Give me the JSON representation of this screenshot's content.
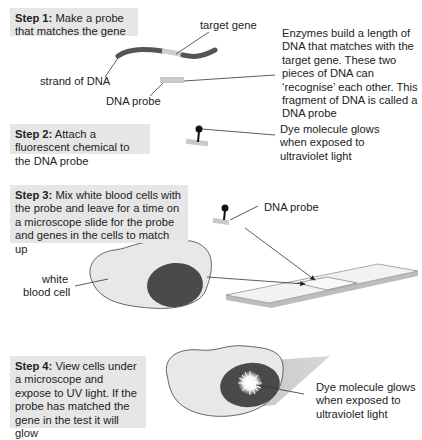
{
  "steps": [
    {
      "label": "Step 1:",
      "text": " Make a probe that matches the gene"
    },
    {
      "label": "Step 2:",
      "text": " Attach a fluorescent chemical to the DNA probe"
    },
    {
      "label": "Step 3:",
      "text": " Mix white blood cells with the probe and leave for a time on a microscope slide for the probe and genes in the cells to match up"
    },
    {
      "label": "Step 4:",
      "text": " View cells under a microscope and expose to UV light. If the probe has matched the gene in the test it will glow"
    }
  ],
  "step1": {
    "target_gene_label": "target gene",
    "strand_label": "strand of DNA",
    "probe_label": "DNA probe",
    "description": "Enzymes build a length of DNA that matches with the target gene. These two pieces of DNA can ‘recognise’ each other. This fragment of DNA is called a DNA probe"
  },
  "step2": {
    "dye_description": "Dye molecule glows when exposed to ultraviolet light"
  },
  "step3": {
    "probe_label": "DNA probe",
    "cell_label_line1": "white",
    "cell_label_line2": "blood cell"
  },
  "step4": {
    "dye_description": "Dye molecule glows when exposed to ultraviolet light"
  },
  "colors": {
    "step_box_bg": "#e6e6e6",
    "dna_strand": "#555555",
    "target_gene": "#cccccc",
    "probe": "#c8c8c8",
    "cell_body": "#e8e8e8",
    "nucleus": "#4a4a4a",
    "slide": "#f2f2f2"
  }
}
